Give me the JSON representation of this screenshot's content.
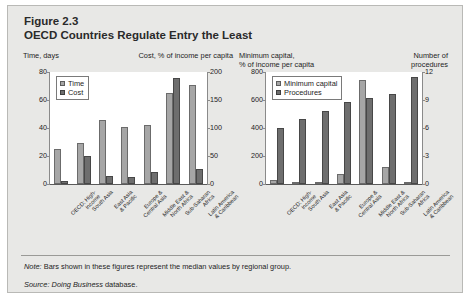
{
  "figure": {
    "number": "Figure 2.3",
    "title": "OECD Countries Regulate Entry the Least",
    "note_label": "Note:",
    "note_text": "Bars shown in these figures represent the median values by regional group.",
    "source_label": "Source:",
    "source_italic": "Doing Business",
    "source_rest": "database.",
    "panel_bg": "#e8e8e6",
    "plot_bg": "#ffffff",
    "series1_color": "#a6a6a6",
    "series2_color": "#6e6e6e"
  },
  "chart_data": [
    {
      "type": "bar",
      "id": "left",
      "title": "",
      "categories": [
        "OECD: High-\nincome",
        "South Asia",
        "East Asia\n& Pacific",
        "Europe &\nCentral Asia",
        "Middle East\n& North Africa",
        "Sub-Saharan\nAfrica",
        "Latin America\n& Caribbean"
      ],
      "left_axis_label": "Time, days",
      "right_axis_label": "Cost, % of income per capita",
      "ylim": [
        0,
        80
      ],
      "yticks": [
        0,
        20,
        40,
        60,
        80
      ],
      "y2lim": [
        0,
        200
      ],
      "y2ticks": [
        0,
        50,
        100,
        150,
        200
      ],
      "grid": false,
      "legend_position": "top-left",
      "series": [
        {
          "name": "Time",
          "axis": "left",
          "values": [
            25,
            29,
            46,
            41,
            42,
            65,
            71
          ]
        },
        {
          "name": "Cost",
          "axis": "right",
          "values": [
            5,
            50,
            15,
            13,
            22,
            190,
            27
          ]
        }
      ]
    },
    {
      "type": "bar",
      "id": "right",
      "title": "",
      "categories": [
        "OECD: High-\nincome",
        "South Asia",
        "East Asia\n& Pacific",
        "Europe &\nCentral Asia",
        "Middle East\n& North Africa",
        "Sub-Saharan\nAfrica",
        "Latin America\n& Caribbean"
      ],
      "left_axis_label": "Minimum capital,\n% of income per capita",
      "right_axis_label": "Number of\nprocedures",
      "ylim": [
        0,
        800
      ],
      "yticks": [
        0,
        200,
        400,
        600,
        800
      ],
      "y2lim": [
        0,
        13.9
      ],
      "y2ticks": [
        0,
        3,
        6,
        9,
        12
      ],
      "grid": false,
      "legend_position": "top-left",
      "series": [
        {
          "name": "Minimum capital",
          "axis": "left",
          "values": [
            30,
            0,
            10,
            70,
            740,
            120,
            0
          ]
        },
        {
          "name": "Procedures",
          "axis": "right",
          "values": [
            7.0,
            8.1,
            9.1,
            10.2,
            10.7,
            11.2,
            13.3
          ]
        }
      ]
    }
  ],
  "left_chart": {
    "head_left": "Time, days",
    "head_right": "Cost, % of income per capita",
    "yticks": [
      "80",
      "60",
      "40",
      "20",
      "0"
    ],
    "y2ticks": [
      "200",
      "150",
      "100",
      "50",
      "0"
    ],
    "legend": [
      "Time",
      "Cost"
    ]
  },
  "right_chart": {
    "head_left_line1": "Minimum capital,",
    "head_left_line2": "% of income per capita",
    "head_right_line1": "Number of",
    "head_right_line2": "procedures",
    "yticks": [
      "800",
      "600",
      "400",
      "200",
      "0"
    ],
    "y2ticks": [
      "12",
      "9",
      "6",
      "3",
      "0"
    ],
    "legend": [
      "Minimum capital",
      "Procedures"
    ]
  },
  "categories_display": [
    [
      "OECD: High-",
      "income"
    ],
    [
      "South Asia",
      ""
    ],
    [
      "East Asia",
      "& Pacific"
    ],
    [
      "Europe &",
      "Central Asia"
    ],
    [
      "Middle East &",
      "North Africa"
    ],
    [
      "Sub-Saharan",
      "Africa"
    ],
    [
      "Latin America",
      "& Caribbean"
    ]
  ]
}
